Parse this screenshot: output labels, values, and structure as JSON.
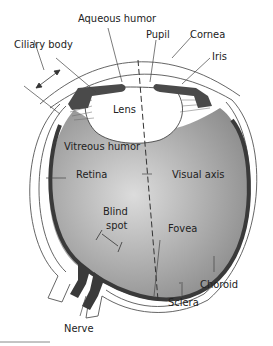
{
  "labels": {
    "aqueous_humor": "Aqueous humor",
    "pupil": "Pupil",
    "cornea": "Cornea",
    "ciliary_body": "Ciliary body",
    "iris": "Iris",
    "lens": "Lens",
    "vitreous_humor": "Vitreous humor",
    "retina": "Retina",
    "visual_axis": "Visual axis",
    "blind_spot_1": "Blind",
    "blind_spot_2": "spot",
    "fovea": "Fovea",
    "choroid": "Choroid",
    "sclera": "Sclera",
    "nerve": "Nerve"
  },
  "colors": {
    "vitreous_center": "#d8d8d8",
    "vitreous_edge": "#8e8e8e",
    "retina_dark": "#3a3a3a",
    "iris": "#4a4a4a",
    "line": "#333333"
  }
}
